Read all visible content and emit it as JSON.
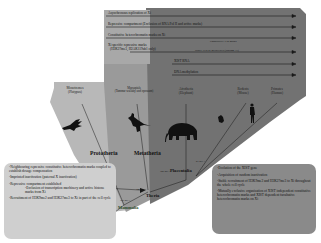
{
  "diagram": {
    "traits": [
      {
        "label": "Asynchronous replication of Xi",
        "row": 0
      },
      {
        "label": "Repressive compartment (Exclusion of RNA Pol II and active marks)",
        "row": 1
      },
      {
        "label": "Constitutive heterochromatin marks on Xi",
        "row": 2
      },
      {
        "label": "Xi specific repressive marks",
        "row": 3,
        "note": "Constitutive Xist marks"
      },
      {
        "label": "(H3K27me3, H2AK119ub1 only)",
        "row": 3.5
      },
      {
        "label": "Stable H3K27 methylated (random Xi)",
        "row": 4
      },
      {
        "label": "XIST RNA",
        "row": 5
      },
      {
        "label": "DNA methylation",
        "row": 6
      }
    ],
    "taxa": [
      {
        "name": "Monotremes",
        "sub": "(Platypus)"
      },
      {
        "name": "Marsupials",
        "sub": "(Tammar wallaby and opossum)"
      },
      {
        "name": "Afrotheria",
        "sub": "(Elephant)"
      },
      {
        "name": "Rodents",
        "sub": "(Mouse)"
      },
      {
        "name": "Primates",
        "sub": "(Human)"
      }
    ],
    "clades": {
      "prototheria": "Prototheria",
      "metatheria": "Metatheria",
      "eutheria": "Placentalia",
      "theria": "Theria",
      "mammalia": "Mammalia"
    },
    "divergence_times": {
      "mammalia": "166 MYA",
      "theria": "148 MYA",
      "placentalia": "105 MYA",
      "boreo": "93 MYA"
    },
    "left_box": {
      "items": [
        "-Neighbouring repressive constitutive heterochromatin marks coupled to establish dosage compensation",
        "-Imprinted inactivation (paternal X inactivation)",
        "-Repressive compartment established",
        "-Exclusion of transcription machinery and active histone marks from Xi",
        "-Recruitment of H3K9me2 and H3K27me3 to Xi in part of the cell cycle"
      ]
    },
    "right_box": {
      "items": [
        "-Evolution of the XIST gene",
        "-Acquisition of random inactivation",
        "-Stable recruitment of H3K9me2 and H3K27me3 to Xi throughout the whole cell cycle",
        "-Mutually exclusive organisation of XIST independent constitutive heterochromatin marks and XIST dependent facultative heterochromatin marks on Xi"
      ]
    },
    "colors": {
      "panel_dark": "#6f6f6f",
      "panel_mid": "#8e8e8e",
      "panel_light": "#b5b5b5",
      "box_left": "#cfcfcf",
      "box_right": "#8a8a8a",
      "line": "#1a1a1a"
    }
  }
}
